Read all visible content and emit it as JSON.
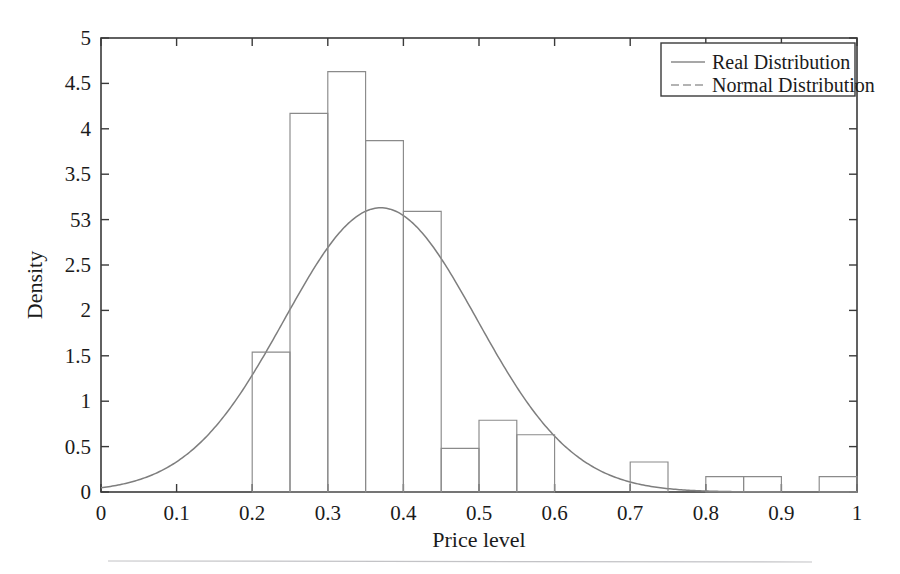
{
  "chart_data": {
    "type": "bar",
    "title": "",
    "subtitle": "",
    "xlabel": "Price level",
    "ylabel": "Density",
    "xlim": [
      0,
      1
    ],
    "ylim": [
      0,
      5
    ],
    "grid": false,
    "legend_position": "top-right",
    "x_tick_labels": [
      "0",
      "0.1",
      "0.2",
      "0.3",
      "0.4",
      "0.5",
      "0.6",
      "0.7",
      "0.8",
      "0.9",
      "1"
    ],
    "x_tick_values": [
      0,
      0.1,
      0.2,
      0.3,
      0.4,
      0.5,
      0.6,
      0.7,
      0.8,
      0.9,
      1
    ],
    "y_tick_labels": [
      "0",
      "0.5",
      "1",
      "1.5",
      "2",
      "2.5",
      "53",
      "3.5",
      "4",
      "4.5",
      "5"
    ],
    "y_tick_values": [
      0,
      0.5,
      1,
      1.5,
      2,
      2.5,
      3,
      3.5,
      4,
      4.5,
      5
    ],
    "bin_width": 0.05,
    "bin_edges": [
      0.2,
      0.25,
      0.3,
      0.35,
      0.4,
      0.45,
      0.5,
      0.55,
      0.6,
      0.7,
      0.75,
      0.8,
      0.85,
      0.9,
      0.95,
      1.0
    ],
    "bars": [
      {
        "x0": 0.2,
        "x1": 0.25,
        "height": 1.54
      },
      {
        "x0": 0.25,
        "x1": 0.3,
        "height": 4.17
      },
      {
        "x0": 0.3,
        "x1": 0.35,
        "height": 4.63
      },
      {
        "x0": 0.35,
        "x1": 0.4,
        "height": 3.87
      },
      {
        "x0": 0.4,
        "x1": 0.45,
        "height": 3.09
      },
      {
        "x0": 0.45,
        "x1": 0.5,
        "height": 0.48
      },
      {
        "x0": 0.5,
        "x1": 0.55,
        "height": 0.79
      },
      {
        "x0": 0.55,
        "x1": 0.6,
        "height": 0.63
      },
      {
        "x0": 0.7,
        "x1": 0.75,
        "height": 0.33
      },
      {
        "x0": 0.8,
        "x1": 0.85,
        "height": 0.17
      },
      {
        "x0": 0.85,
        "x1": 0.9,
        "height": 0.17
      },
      {
        "x0": 0.95,
        "x1": 1.0,
        "height": 0.17
      }
    ],
    "series": [
      {
        "name": "Real Distribution",
        "kind": "histogram",
        "categories": [
          "0.20-0.25",
          "0.25-0.30",
          "0.30-0.35",
          "0.35-0.40",
          "0.40-0.45",
          "0.45-0.50",
          "0.50-0.55",
          "0.55-0.60",
          "0.70-0.75",
          "0.80-0.85",
          "0.85-0.90",
          "0.95-1.00"
        ],
        "values": [
          1.54,
          4.17,
          4.63,
          3.87,
          3.09,
          0.48,
          0.79,
          0.63,
          0.33,
          0.17,
          0.17,
          0.17
        ]
      },
      {
        "name": "Normal Distribution",
        "kind": "line",
        "mean": 0.37,
        "sigma": 0.1275,
        "peak": 3.13,
        "x": [
          0.0,
          0.05,
          0.1,
          0.15,
          0.2,
          0.25,
          0.3,
          0.35,
          0.37,
          0.4,
          0.45,
          0.5,
          0.55,
          0.6,
          0.65,
          0.7,
          0.75,
          0.8,
          0.85,
          0.9,
          0.95,
          1.0
        ],
        "values": [
          0.06,
          0.16,
          0.38,
          0.79,
          1.44,
          2.29,
          2.95,
          3.11,
          3.13,
          3.02,
          2.42,
          1.59,
          0.86,
          0.38,
          0.14,
          0.04,
          0.01,
          0.0,
          0.0,
          0.0,
          0.0,
          0.0
        ]
      }
    ]
  },
  "legend": {
    "entries": [
      {
        "label": "Real Distribution",
        "style": "solid"
      },
      {
        "label": "Normal Distribution",
        "style": "dashed"
      }
    ]
  },
  "axes": {
    "x_title": "Price level",
    "y_title": "Density"
  }
}
